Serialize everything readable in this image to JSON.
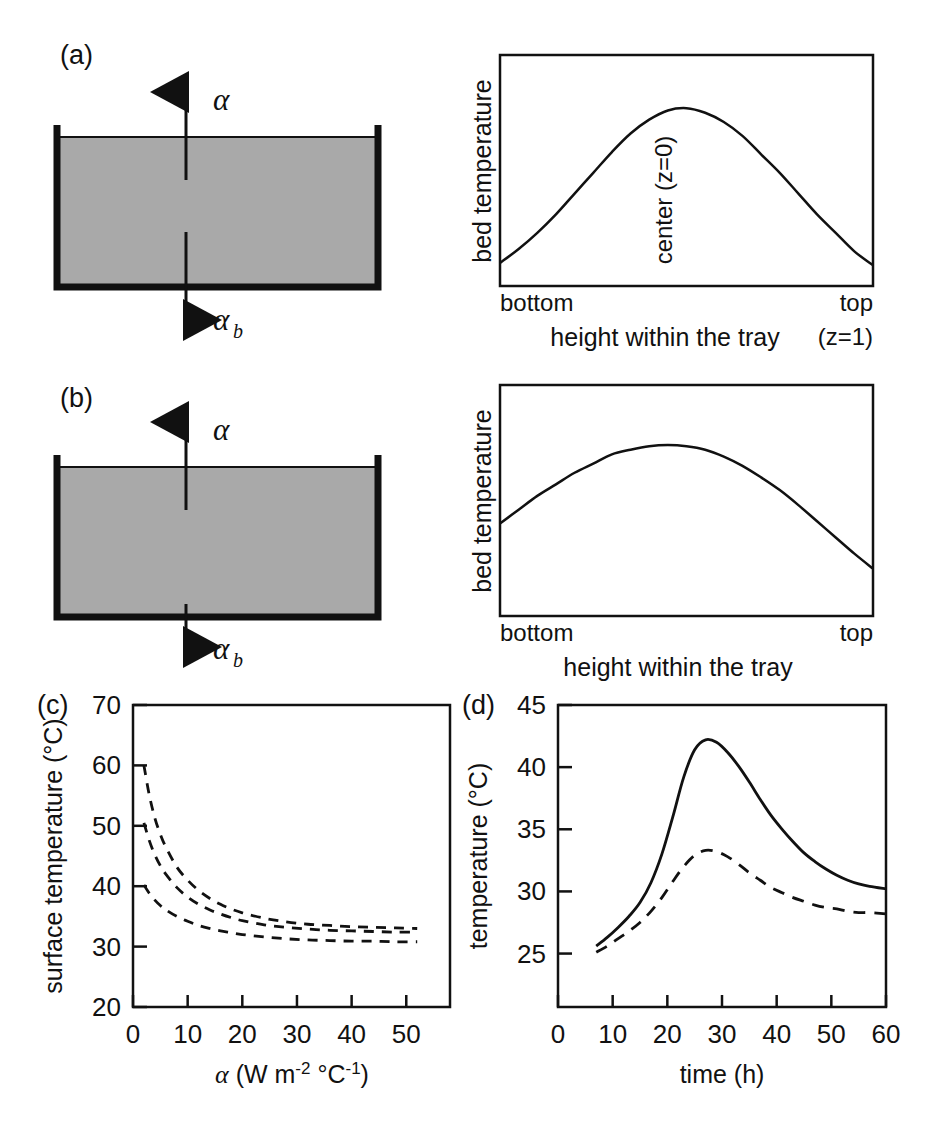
{
  "figure": {
    "background": "#ffffff",
    "line_color": "#111111",
    "bed_fill": "#a9a9a9"
  },
  "panels": {
    "a": {
      "label": "(a)",
      "diagram": {
        "name": "tray-cross-section",
        "arrow_top_label": "α",
        "arrow_bottom_label": "α",
        "arrow_bottom_sub": "b",
        "top_arrow_style": "long-from-inside-up",
        "bottom_arrow_style": "long-from-inside-down"
      }
    },
    "b": {
      "label": "(b)",
      "diagram": {
        "name": "tray-cross-section",
        "arrow_top_label": "α",
        "arrow_bottom_label": "α",
        "arrow_bottom_sub": "b",
        "top_arrow_style": "long-from-inside-up",
        "bottom_arrow_style": "short-below-down"
      }
    },
    "c": {
      "label": "(c)"
    },
    "d": {
      "label": "(d)"
    }
  },
  "chart_data": [
    {
      "id": "panel-a-profile",
      "type": "line",
      "title": "",
      "xlabel": "height within the tray",
      "ylabel": "bed temperature",
      "xtick_labels": [
        "bottom",
        "top"
      ],
      "xtick_sublabel": "(z=1)",
      "annotation": "center (z=0)",
      "grid": false,
      "legend": "none",
      "xlim": [
        0,
        1
      ],
      "ylim": [
        0,
        1
      ],
      "series": [
        {
          "name": "bed temperature profile",
          "style": "solid",
          "x": [
            0.0,
            0.05,
            0.1,
            0.15,
            0.2,
            0.25,
            0.3,
            0.35,
            0.4,
            0.45,
            0.5,
            0.55,
            0.6,
            0.65,
            0.7,
            0.75,
            0.8,
            0.85,
            0.9,
            0.95,
            1.0
          ],
          "y": [
            0.1,
            0.16,
            0.23,
            0.31,
            0.4,
            0.49,
            0.58,
            0.66,
            0.72,
            0.76,
            0.77,
            0.75,
            0.71,
            0.65,
            0.57,
            0.49,
            0.4,
            0.31,
            0.23,
            0.15,
            0.09
          ]
        }
      ]
    },
    {
      "id": "panel-b-profile",
      "type": "line",
      "title": "",
      "xlabel": "height within the tray",
      "ylabel": "bed temperature",
      "xtick_labels": [
        "bottom",
        "top"
      ],
      "annotation": "",
      "grid": false,
      "legend": "none",
      "xlim": [
        0,
        1
      ],
      "ylim": [
        0,
        1
      ],
      "series": [
        {
          "name": "bed temperature profile",
          "style": "solid",
          "x": [
            0.0,
            0.05,
            0.1,
            0.15,
            0.2,
            0.25,
            0.3,
            0.35,
            0.4,
            0.45,
            0.5,
            0.55,
            0.6,
            0.65,
            0.7,
            0.75,
            0.8,
            0.85,
            0.9,
            0.95,
            1.0
          ],
          "y": [
            0.4,
            0.46,
            0.52,
            0.57,
            0.62,
            0.66,
            0.7,
            0.72,
            0.735,
            0.74,
            0.735,
            0.72,
            0.69,
            0.65,
            0.6,
            0.545,
            0.48,
            0.41,
            0.34,
            0.27,
            0.205
          ]
        }
      ]
    },
    {
      "id": "panel-c-surface-temperature",
      "type": "line",
      "title": "",
      "xlabel": "α (W m⁻² °C⁻¹)",
      "ylabel": "surface temperature (°C)",
      "xlim": [
        0,
        58
      ],
      "ylim": [
        20,
        70
      ],
      "xticks": [
        0,
        10,
        20,
        30,
        40,
        50
      ],
      "yticks": [
        20,
        30,
        40,
        50,
        60,
        70
      ],
      "grid": false,
      "legend": "none",
      "series": [
        {
          "name": "upper curve",
          "style": "dashed",
          "x": [
            2,
            3,
            4,
            5,
            6,
            8,
            10,
            12,
            14,
            16,
            18,
            20,
            24,
            28,
            32,
            36,
            40,
            44,
            48,
            52
          ],
          "y": [
            60.0,
            55.0,
            51.3,
            48.6,
            46.5,
            43.2,
            41.0,
            39.3,
            38.0,
            37.0,
            36.2,
            35.6,
            34.7,
            34.1,
            33.7,
            33.5,
            33.3,
            33.2,
            33.1,
            33.0
          ]
        },
        {
          "name": "middle curve",
          "style": "dashed",
          "x": [
            2,
            3,
            4,
            5,
            6,
            8,
            10,
            12,
            14,
            16,
            18,
            20,
            24,
            28,
            32,
            36,
            40,
            44,
            48,
            52
          ],
          "y": [
            50.5,
            47.5,
            45.2,
            43.4,
            42.0,
            39.8,
            38.2,
            37.0,
            36.1,
            35.4,
            34.8,
            34.3,
            33.6,
            33.2,
            32.9,
            32.7,
            32.6,
            32.5,
            32.4,
            32.4
          ]
        },
        {
          "name": "lower curve",
          "style": "dashed",
          "x": [
            2,
            3,
            4,
            5,
            6,
            8,
            10,
            12,
            14,
            16,
            18,
            20,
            24,
            28,
            32,
            36,
            40,
            44,
            48,
            52
          ],
          "y": [
            40.2,
            38.8,
            37.7,
            36.8,
            36.1,
            35.0,
            34.2,
            33.5,
            33.0,
            32.6,
            32.3,
            32.0,
            31.6,
            31.3,
            31.1,
            31.0,
            30.9,
            30.9,
            30.8,
            30.8
          ]
        }
      ]
    },
    {
      "id": "panel-d-temperature-vs-time",
      "type": "line",
      "title": "",
      "xlabel": "time (h)",
      "ylabel": "temperature (°C)",
      "xlim": [
        0,
        60
      ],
      "ylim": [
        20.7,
        45
      ],
      "xticks": [
        0,
        10,
        20,
        30,
        40,
        50,
        60
      ],
      "yticks": [
        25,
        30,
        35,
        40,
        45
      ],
      "grid": false,
      "legend": "none",
      "series": [
        {
          "name": "solid curve",
          "style": "solid",
          "x": [
            7,
            9,
            11,
            13,
            15,
            17,
            19,
            21,
            23,
            25,
            27,
            29,
            31,
            33,
            35,
            37,
            39,
            41,
            43,
            45,
            47,
            49,
            51,
            53,
            55,
            57,
            60
          ],
          "y": [
            25.6,
            26.3,
            27.1,
            28.0,
            29.1,
            30.7,
            33.0,
            36.0,
            39.2,
            41.4,
            42.2,
            42.0,
            41.2,
            40.1,
            38.8,
            37.4,
            36.1,
            35.0,
            34.0,
            33.1,
            32.4,
            31.8,
            31.3,
            30.9,
            30.6,
            30.4,
            30.2
          ]
        },
        {
          "name": "dashed curve",
          "style": "dashed",
          "x": [
            7,
            9,
            11,
            13,
            15,
            17,
            19,
            21,
            23,
            25,
            27,
            29,
            31,
            33,
            35,
            37,
            39,
            41,
            43,
            45,
            47,
            49,
            51,
            53,
            55,
            57,
            60
          ],
          "y": [
            25.1,
            25.6,
            26.2,
            26.8,
            27.5,
            28.4,
            29.5,
            30.8,
            32.0,
            32.9,
            33.3,
            33.2,
            32.8,
            32.2,
            31.5,
            30.9,
            30.3,
            29.9,
            29.5,
            29.2,
            28.9,
            28.7,
            28.6,
            28.4,
            28.3,
            28.3,
            28.2
          ]
        }
      ]
    }
  ]
}
